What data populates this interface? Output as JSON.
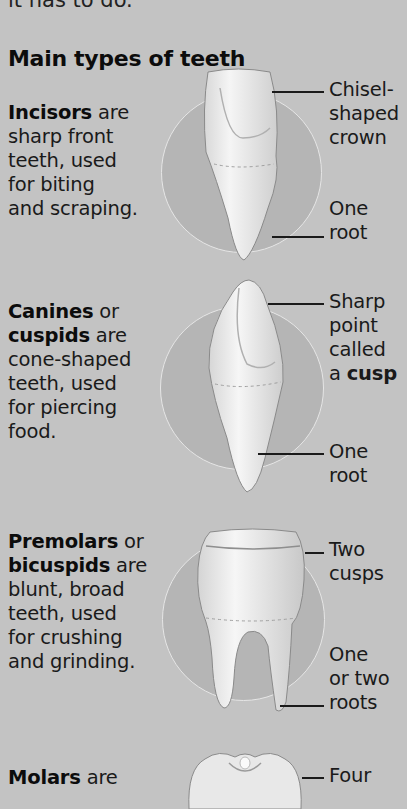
{
  "page": {
    "cut_top_line": "it has to do.",
    "heading": "Main types of teeth"
  },
  "teeth": [
    {
      "name": "Incisors",
      "desc_bold": "Incisors",
      "desc_line1_rest": " are",
      "desc_lines": [
        "sharp front",
        "teeth, used",
        "for biting",
        "and scraping."
      ],
      "labels": [
        {
          "lines": [
            "Chisel-",
            "shaped",
            "crown"
          ]
        },
        {
          "lines": [
            "One",
            "root"
          ]
        }
      ]
    },
    {
      "name": "Canines",
      "desc_bold": "Canines",
      "desc_line1_rest": " or",
      "desc_bold2": "cuspids",
      "desc_line2_rest": " are",
      "desc_lines": [
        "cone-shaped",
        "teeth, used",
        "for piercing",
        "food."
      ],
      "labels": [
        {
          "lines": [
            "Sharp",
            "point",
            "called"
          ],
          "last_prefix": "a ",
          "last_bold": "cusp"
        },
        {
          "lines": [
            "One",
            "root"
          ]
        }
      ]
    },
    {
      "name": "Premolars",
      "desc_bold": "Premolars",
      "desc_line1_rest": " or",
      "desc_bold2": "bicuspids",
      "desc_line2_rest": " are",
      "desc_lines": [
        "blunt, broad",
        "teeth, used",
        "for crushing",
        "and grinding."
      ],
      "labels": [
        {
          "lines": [
            "Two",
            "cusps"
          ]
        },
        {
          "lines": [
            "One",
            "or two",
            "roots"
          ]
        }
      ]
    },
    {
      "name": "Molars",
      "desc_bold": "Molars",
      "desc_line1_rest": " are",
      "labels": [
        {
          "lines": [
            "Four"
          ]
        }
      ]
    }
  ],
  "colors": {
    "background": "#c3c3c3",
    "circle": "#b5b5b5",
    "circle_outline": "#e6e6e6",
    "tooth": "#ececec",
    "text": "#1a1a1a"
  }
}
